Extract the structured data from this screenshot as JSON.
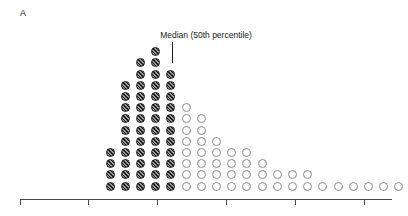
{
  "figure": {
    "panel_letter": "A",
    "background_color": "#ffffff"
  },
  "annotation": {
    "median_label": "Median (50th percentile)",
    "median_label_x": 206,
    "median_label_y": 30,
    "leader_x": 172,
    "leader_top": 42,
    "leader_bottom": 63,
    "leader_color": "#1a1a1a"
  },
  "colors": {
    "filled_stroke": "#1c1c1c",
    "filled_fill": "#9a9a9a",
    "open_stroke": "#8f8f8f",
    "open_fill": "#ffffff",
    "axis": "#4a4a4a",
    "text": "#1a1a1a"
  },
  "axis": {
    "y": 199,
    "x_start": 20,
    "x_end": 392,
    "tick_length": 6,
    "tick_positions": [
      20,
      88,
      157,
      226,
      295,
      364
    ],
    "tick_labels": []
  },
  "chart_data": {
    "type": "bar",
    "subtype": "stacked-dot-histogram",
    "title": "",
    "subtitle": "",
    "xlabel": "",
    "ylabel": "",
    "grid": false,
    "legend_position": "none",
    "annotations": [
      {
        "text": "Median (50th percentile)",
        "points_to_column_index": 5,
        "x_px": 172
      }
    ],
    "dot_geometry": {
      "first_column_x": 110,
      "column_spacing": 15.2,
      "baseline_y": 186,
      "row_spacing": 11.2,
      "dot_diameter": 9
    },
    "categories": [
      1,
      2,
      3,
      4,
      5,
      6,
      7,
      8,
      9,
      10,
      11,
      12,
      13,
      14,
      15,
      16,
      17,
      18,
      19,
      20
    ],
    "values": [
      4,
      10,
      12,
      13,
      11,
      8,
      7,
      5,
      4,
      4,
      3,
      2,
      2,
      2,
      1,
      1,
      1,
      1,
      1,
      1
    ],
    "series": [
      {
        "name": "At or below median (hatched)",
        "style": "filled-hatched",
        "values": [
          4,
          10,
          12,
          13,
          11,
          0,
          0,
          0,
          0,
          0,
          0,
          0,
          0,
          0,
          0,
          0,
          0,
          0,
          0,
          0
        ]
      },
      {
        "name": "Above median (open)",
        "style": "open",
        "values": [
          0,
          0,
          0,
          0,
          0,
          8,
          7,
          5,
          4,
          4,
          3,
          2,
          2,
          2,
          1,
          1,
          1,
          1,
          1,
          1
        ]
      }
    ],
    "ylim": [
      0,
      13
    ],
    "xlim_px": [
      20,
      392
    ]
  }
}
